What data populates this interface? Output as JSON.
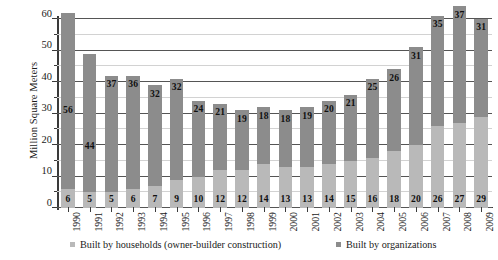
{
  "chart_data": {
    "type": "bar",
    "subtype": "stacked-vertical",
    "title": "",
    "xlabel": "",
    "ylabel": "Million Square Meters",
    "ylim": [
      0,
      60
    ],
    "yticks": [
      0,
      10,
      20,
      30,
      40,
      50,
      60
    ],
    "yticks_minor": [
      5,
      15,
      25,
      35,
      45,
      55
    ],
    "grid": "horizontal",
    "legend_position": "bottom",
    "categories": [
      "1990",
      "1991",
      "1992",
      "1993",
      "1994",
      "1995",
      "1996",
      "1997",
      "1998",
      "1999",
      "2000",
      "2001",
      "2002",
      "2003",
      "2004",
      "2005",
      "2006",
      "2007",
      "2008",
      "2009"
    ],
    "series": [
      {
        "name": "Built by households (owner-builder construction)",
        "color": "#b9b9b9",
        "values": [
          6,
          5,
          5,
          6,
          7,
          9,
          10,
          12,
          12,
          14,
          13,
          13,
          14,
          15,
          16,
          18,
          20,
          26,
          27,
          29
        ]
      },
      {
        "name": "Built by organizations",
        "color": "#8c8c8c",
        "values": [
          56,
          44,
          37,
          36,
          32,
          32,
          24,
          21,
          19,
          18,
          18,
          19,
          20,
          21,
          25,
          26,
          31,
          35,
          37,
          31
        ]
      }
    ],
    "totals": [
      62,
      49,
      42,
      42,
      39,
      41,
      34,
      33,
      31,
      32,
      31,
      32,
      34,
      36,
      41,
      44,
      51,
      61,
      64,
      60
    ]
  },
  "legend": {
    "entries": [
      {
        "label": "Built by households (owner-builder construction)"
      },
      {
        "label": "Built by organizations"
      }
    ]
  }
}
